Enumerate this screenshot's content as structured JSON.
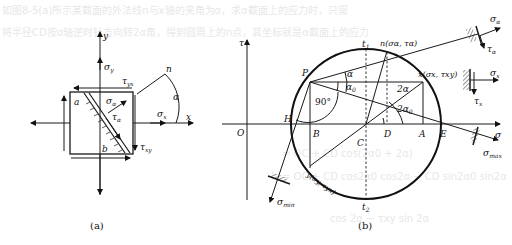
{
  "background_text": {
    "line1": "如图8-5(a)所示某截面的外法线n与x轴的夹角为α，求α截面上的应力时，只需",
    "line2": "将半径CD按σ轴逆时针方向转2α角，得到圆周上的n点，其坐标就是α截面上的应力",
    "formula1": "= OC + CD cos(2α0 + 2α)",
    "formula2": "= OC + CD cos2α0 cos2α − CD sin2α0 sin2α",
    "formula3": "cos 2α − τxy sin 2α"
  },
  "panel_a": {
    "caption": "(a)",
    "axis_x": "x",
    "axis_y": "y",
    "normal": "n",
    "angle": "α",
    "sigma_y": "σ",
    "sigma_y_sub": "y",
    "sigma_x": "σ",
    "sigma_x_sub": "x",
    "sigma_a": "σ",
    "sigma_a_sub": "α",
    "tau_a": "τ",
    "tau_a_sub": "α",
    "tau_yx": "τ",
    "tau_yx_sub": "yx",
    "tau_xy": "τ",
    "tau_xy_sub": "xy",
    "corner_a": "a",
    "corner_b": "b"
  },
  "panel_b": {
    "caption": "(b)",
    "axis_tau": "τ",
    "axis_sigma": "σ",
    "origin": "O",
    "points": {
      "P": "P",
      "H": "H",
      "B": "B",
      "C": "C",
      "D": "D",
      "A": "A",
      "E": "E",
      "t1": "t",
      "t1_sub": "1",
      "t2": "t",
      "t2_sub": "2",
      "n": "n(σα, τα)",
      "x": "x(σx, τxy)",
      "y": "y(σy, τyx)"
    },
    "angles": {
      "alpha": "α",
      "alpha0": "α",
      "alpha0_sub": "0",
      "right": "90°",
      "two_alpha": "2α",
      "two_alpha0": "2α",
      "two_alpha0_sub": "0"
    },
    "stresses": {
      "sigma_max": "σ",
      "sigma_max_sub": "max",
      "sigma_min": "σ",
      "sigma_min_sub": "min",
      "sigma_a": "σ",
      "sigma_a_sub": "α",
      "tau_a": "τ",
      "tau_a_sub": "α",
      "sigma_x": "σ",
      "sigma_x_sub": "x",
      "tau_x": "τ",
      "tau_x_sub": "x"
    }
  }
}
